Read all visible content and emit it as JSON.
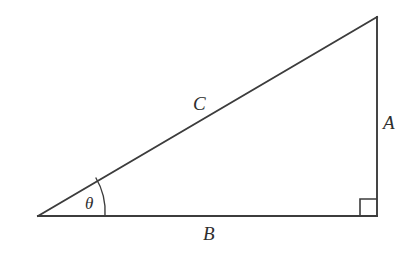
{
  "figure": {
    "kind": "right-triangle-diagram",
    "background_color": "#ffffff",
    "stroke_color": "#3c3c3c",
    "text_color": "#2e2e2e"
  },
  "vertices": {
    "left_acute": {
      "x": 38,
      "y": 216
    },
    "right_angle": {
      "x": 377,
      "y": 216
    },
    "apex": {
      "x": 377,
      "y": 17
    }
  },
  "labels": {
    "side_a": "A",
    "side_b": "B",
    "hypotenuse_c": "C",
    "angle_theta": "θ"
  },
  "markers": {
    "right_angle_square_size": 17,
    "angle_arc_radius": 67
  }
}
